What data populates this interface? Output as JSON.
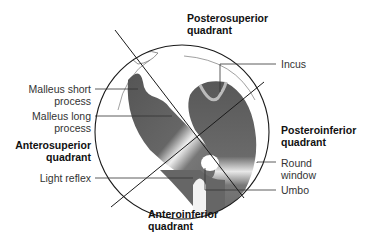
{
  "labels": {
    "posterosuperior": [
      "Posterosuperior",
      "quadrant"
    ],
    "incus": "Incus",
    "malleus_short": [
      "Malleus short",
      "process"
    ],
    "malleus_long": [
      "Malleus long",
      "process"
    ],
    "anterosuperior": [
      "Anterosuperior",
      "quadrant"
    ],
    "posteroinferior": [
      "Posteroinferior",
      "quadrant"
    ],
    "light_reflex": "Light reflex",
    "round_window": [
      "Round",
      "window"
    ],
    "umbo": "Umbo",
    "anteroinferior": [
      "Anteroinferior",
      "quadrant"
    ]
  },
  "colors": {
    "ossicle_dark": "#5e5e5e",
    "outline": "#1a1a1a",
    "highlight": "#f2f2f2"
  }
}
